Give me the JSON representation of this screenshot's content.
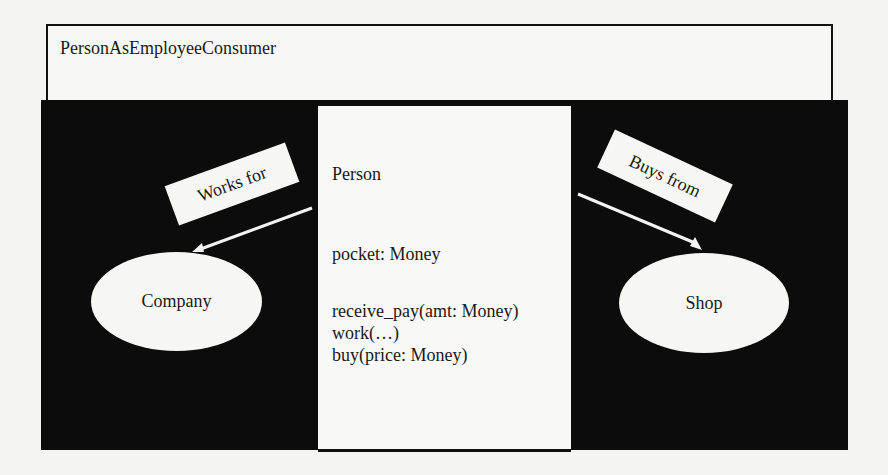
{
  "diagram": {
    "title": "PersonAsEmployeeConsumer",
    "person": {
      "class_name": "Person",
      "attribute": "pocket: Money",
      "operations": [
        "receive_pay(amt: Money)",
        "work(…)",
        "buy(price: Money)"
      ]
    },
    "nodes": {
      "company": "Company",
      "shop": "Shop"
    },
    "relations": {
      "works_for": "Works for",
      "buys_from": "Buys from"
    },
    "colors": {
      "panel": "#0c0c0c",
      "box": "#f8f8f6",
      "background": "#f4f4f2"
    }
  }
}
